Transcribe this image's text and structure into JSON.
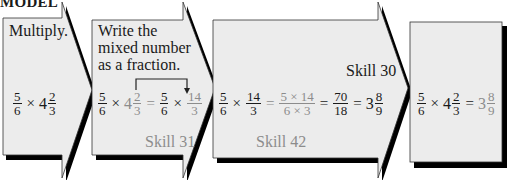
{
  "title": "MODEL",
  "colors": {
    "panel_fill": "#ececec",
    "shadow": "#000000",
    "text": "#1a1a1a",
    "highlight_gray": "#8c8c8c"
  },
  "steps": [
    {
      "label": "Multiply.",
      "expression": {
        "a_num": "5",
        "a_den": "6",
        "op": "×",
        "whole": "4",
        "b_num": "2",
        "b_den": "3"
      }
    },
    {
      "label_lines": [
        "Write the",
        "mixed number",
        "as a fraction."
      ],
      "expression": {
        "a_num": "5",
        "a_den": "6",
        "op": "×",
        "whole": "4",
        "b_num": "2",
        "b_den": "3",
        "eq": "=",
        "c_num": "5",
        "c_den": "6",
        "op2": "×",
        "d_num": "14",
        "d_den": "3"
      },
      "skill": "Skill 31"
    },
    {
      "skill_top": "Skill 30",
      "expression": {
        "a_num": "5",
        "a_den": "6",
        "op": "×",
        "b_num": "14",
        "b_den": "3",
        "eq1": "=",
        "c_num": "5 × 14",
        "c_den": "6 × 3",
        "eq2": "=",
        "d_num": "70",
        "d_den": "18",
        "eq3": "=",
        "whole": "3",
        "e_num": "8",
        "e_den": "9"
      },
      "skill": "Skill 42"
    },
    {
      "expression": {
        "a_num": "5",
        "a_den": "6",
        "op": "×",
        "whole": "4",
        "b_num": "2",
        "b_den": "3",
        "eq": "=",
        "r_whole": "3",
        "r_num": "8",
        "r_den": "9"
      }
    }
  ]
}
